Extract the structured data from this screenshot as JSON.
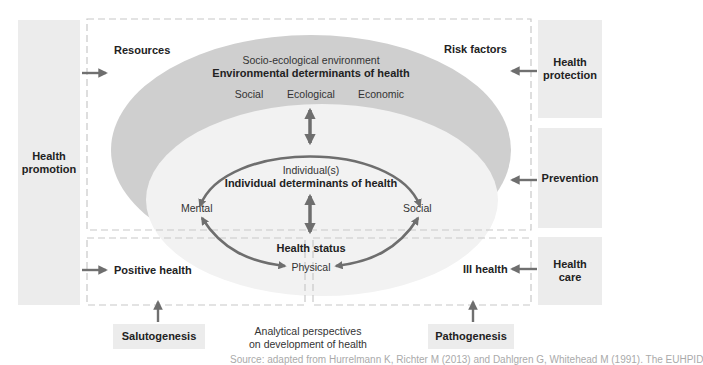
{
  "left_panel": {
    "label_line1": "Health",
    "label_line2": "promotion"
  },
  "right_panels": [
    {
      "label_line1": "Health",
      "label_line2": "protection"
    },
    {
      "label_line1": "Prevention",
      "label_line2": ""
    },
    {
      "label_line1": "Health",
      "label_line2": "care"
    }
  ],
  "corner_labels": {
    "resources": "Resources",
    "risk_factors": "Risk factors",
    "positive_health": "Positive health",
    "ill_health": "Ill health"
  },
  "environment": {
    "subtitle": "Socio-ecological environment",
    "title": "Environmental determinants of health",
    "categories": [
      "Social",
      "Ecological",
      "Economic"
    ]
  },
  "individual": {
    "subtitle": "Individual(s)",
    "title": "Individual determinants of health",
    "health_status": "Health status",
    "dimensions": {
      "mental": "Mental",
      "social": "Social",
      "physical": "Physical"
    }
  },
  "bottom": {
    "salutogenesis": "Salutogenesis",
    "pathogenesis": "Pathogenesis",
    "caption_line1": "Analytical perspectives",
    "caption_line2": "on development of health",
    "cutoff_caption": "Source: adapted from Hurrelmann K, Richter M (2013) and Dahlgren G, Whitehead M (1991). The EUHPID"
  },
  "colors": {
    "panel_bg": "#ececec",
    "outer_ellipse": "#cfcfcf",
    "inner_ellipse": "#f2f2f2",
    "arrow": "#707070",
    "dash": "#c8c8c8"
  }
}
